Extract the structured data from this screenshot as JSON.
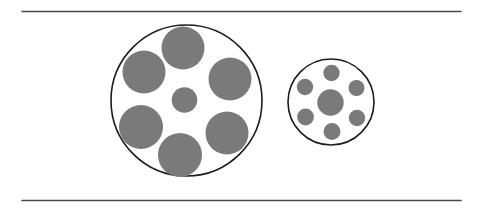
{
  "figure": {
    "background_color": "#ffffff",
    "canvas": {
      "width": 482,
      "height": 213
    }
  },
  "colors": {
    "disc_fill": "#7a7a7a",
    "disc_fill_edge": "#8d8d8d",
    "outline_stroke": "#1c1c1c",
    "rule_stroke": "#4a4a4a",
    "background": "#ffffff"
  },
  "rules": [
    {
      "name": "top-rule",
      "x1": 22,
      "y1": 11.5,
      "x2": 461,
      "y2": 11.5,
      "width": 1.6
    },
    {
      "name": "bottom-rule",
      "x1": 22,
      "y1": 200.5,
      "x2": 461,
      "y2": 200.5,
      "width": 1.6
    }
  ],
  "groups": [
    {
      "name": "left-group",
      "label": "large-surround",
      "outline": {
        "cx": 186.5,
        "cy": 100.5,
        "r": 75.5,
        "stroke_width": 1.6
      },
      "target": {
        "name": "left-target-circle",
        "cx": 184.5,
        "cy": 100.0,
        "r": 12.8
      },
      "inducers": [
        {
          "name": "left-inducer-1",
          "cx": 183.0,
          "cy": 48.0,
          "r": 21.5
        },
        {
          "name": "left-inducer-2",
          "cx": 230.0,
          "cy": 79.0,
          "r": 21.5
        },
        {
          "name": "left-inducer-3",
          "cx": 227.0,
          "cy": 133.0,
          "r": 21.5
        },
        {
          "name": "left-inducer-4",
          "cx": 180.0,
          "cy": 155.0,
          "r": 22.0
        },
        {
          "name": "left-inducer-5",
          "cx": 141.0,
          "cy": 127.0,
          "r": 22.0
        },
        {
          "name": "left-inducer-6",
          "cx": 144.0,
          "cy": 72.0,
          "r": 21.5
        }
      ]
    },
    {
      "name": "right-group",
      "label": "small-surround",
      "outline": {
        "cx": 331.0,
        "cy": 102.0,
        "r": 43.0,
        "stroke_width": 1.6
      },
      "target": {
        "name": "right-target-circle",
        "cx": 330.5,
        "cy": 102.5,
        "r": 13.2
      },
      "inducers": [
        {
          "name": "right-inducer-1",
          "cx": 331.5,
          "cy": 73.0,
          "r": 8.2
        },
        {
          "name": "right-inducer-2",
          "cx": 356.5,
          "cy": 88.0,
          "r": 8.0
        },
        {
          "name": "right-inducer-3",
          "cx": 357.0,
          "cy": 118.0,
          "r": 8.2
        },
        {
          "name": "right-inducer-4",
          "cx": 332.0,
          "cy": 131.5,
          "r": 8.4
        },
        {
          "name": "right-inducer-5",
          "cx": 305.5,
          "cy": 117.0,
          "r": 8.4
        },
        {
          "name": "right-inducer-6",
          "cx": 305.0,
          "cy": 87.0,
          "r": 8.2
        }
      ]
    }
  ]
}
